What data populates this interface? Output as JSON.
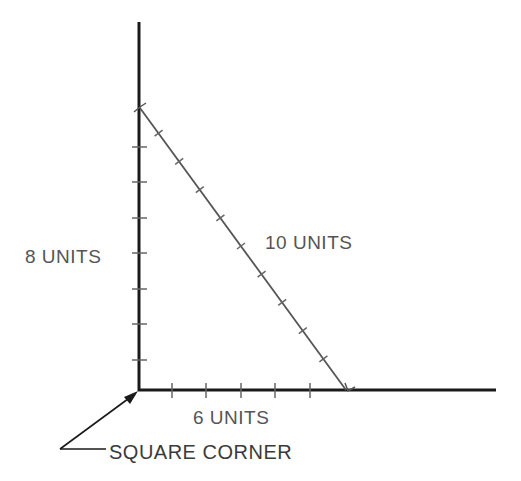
{
  "diagram": {
    "type": "right-triangle-3-4-5",
    "colors": {
      "axis": "#1a1a1a",
      "hypotenuse": "#555555",
      "ticks": "#666666",
      "text": "#555555",
      "background": "#ffffff"
    },
    "labels": {
      "vertical": "8 UNITS",
      "hypotenuse": "10 UNITS",
      "horizontal": "6 UNITS",
      "corner": "SQUARE CORNER"
    },
    "sides": {
      "vertical_units": 8,
      "horizontal_units": 6,
      "hypotenuse_units": 10
    }
  }
}
